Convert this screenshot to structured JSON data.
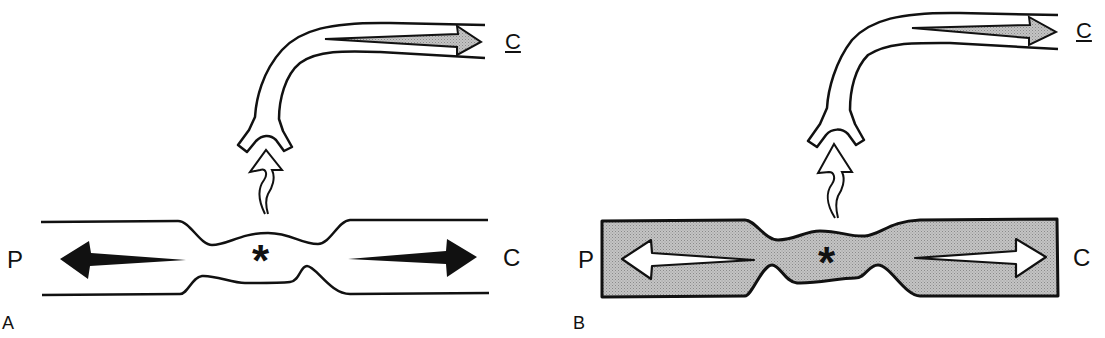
{
  "panels": [
    {
      "id": "A",
      "panel_label": "A",
      "left_label": "P",
      "right_label": "C",
      "branch_label": "C",
      "center_marker": "*",
      "vessel_fill": "#ffffff",
      "arrow_style": "solid-black"
    },
    {
      "id": "B",
      "panel_label": "B",
      "left_label": "P",
      "right_label": "C",
      "branch_label": "C",
      "center_marker": "*",
      "vessel_fill": "#b4b4b4",
      "arrow_style": "hollow-white"
    }
  ],
  "colors": {
    "stroke": "#111111",
    "shaded_fill": "#b4b4b4",
    "branch_arrow_fill": "#a8a8a8"
  }
}
